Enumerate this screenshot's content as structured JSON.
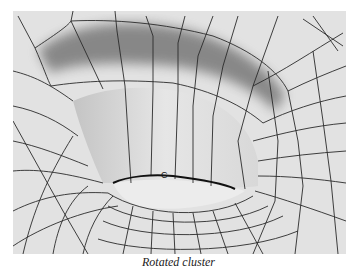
{
  "figure": {
    "caption": "Rotated cluster",
    "label_marker": "C",
    "colors": {
      "surface": "#e3e3e3",
      "shadow": "#8a8a8a",
      "wall": "#cfcfcf",
      "mesh_line": "#2a2a2a",
      "edge_highlight": "#111111"
    }
  }
}
